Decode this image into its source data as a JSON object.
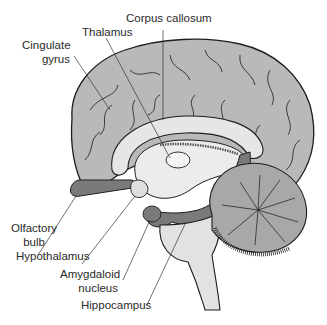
{
  "figure": {
    "colors": {
      "cortex": "#b9b9b9",
      "white_matter": "#e6e6e6",
      "limbic": "#7a7a7a",
      "outline": "#1e1e1e",
      "brainstem": "#dcdcdc",
      "cerebellum": "#a8a8a8",
      "background": "#ffffff"
    }
  },
  "labels": {
    "corpus_callosum": "Corpus callosum",
    "thalamus": "Thalamus",
    "cingulate_gyrus_1": "Cingulate",
    "cingulate_gyrus_2": "gyrus",
    "olfactory_bulb_1": "Olfactory",
    "olfactory_bulb_2": "bulb",
    "hypothalamus": "Hypothalamus",
    "amygdaloid_1": "Amygdaloid",
    "amygdaloid_2": "nucleus",
    "hippocampus": "Hippocampus"
  }
}
